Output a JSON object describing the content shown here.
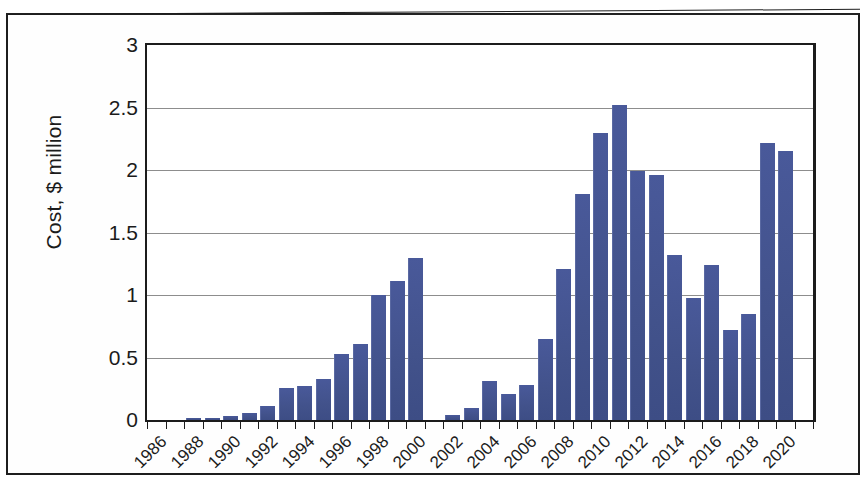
{
  "figure": {
    "kind": "scanned-bar-chart",
    "frame": "document-scan-border"
  },
  "axes": {
    "y_title": "Cost, $ million",
    "y_ticks": [
      "0",
      "0.5",
      "1",
      "1.5",
      "2",
      "2.5",
      "3"
    ],
    "y_min": 0,
    "y_max": 3,
    "x_ticks": [
      "1986",
      "1988",
      "1990",
      "1992",
      "1994",
      "1996",
      "1998",
      "2000",
      "2002",
      "2004",
      "2006",
      "2008",
      "2010",
      "2012",
      "2014",
      "2016",
      "2018",
      "2020"
    ]
  },
  "colors": {
    "bar": "#44548e",
    "gridline": "#8d8d8d",
    "axis": "#1c1c1c",
    "text": "#1b1b1b",
    "background": "#ffffff"
  },
  "chart_data": {
    "type": "bar",
    "title": "",
    "subtitle": "",
    "xlabel": "",
    "ylabel": "Cost, $ million",
    "ylim": [
      0,
      3
    ],
    "ytick_step": 0.5,
    "grid": true,
    "legend": null,
    "categories": [
      "1986",
      "1987",
      "1988",
      "1989",
      "1990",
      "1991",
      "1992",
      "1993",
      "1994",
      "1995",
      "1996",
      "1997",
      "1998",
      "1999",
      "2000",
      "2001",
      "2002",
      "2003",
      "2004",
      "2005",
      "2006",
      "2007",
      "2008",
      "2009",
      "2010",
      "2011",
      "2012",
      "2013",
      "2014",
      "2015",
      "2016",
      "2017",
      "2018",
      "2019",
      "2020",
      "2021"
    ],
    "values": [
      0.0,
      0.0,
      0.02,
      0.02,
      0.03,
      0.06,
      0.11,
      0.26,
      0.27,
      0.33,
      0.53,
      0.61,
      1.0,
      1.11,
      1.3,
      0.0,
      0.04,
      0.1,
      0.31,
      0.21,
      0.28,
      0.65,
      1.21,
      1.81,
      2.3,
      2.52,
      1.99,
      1.96,
      1.32,
      0.98,
      1.24,
      0.72,
      0.85,
      2.22,
      2.15,
      0.0
    ],
    "value_unit": "$ million"
  }
}
